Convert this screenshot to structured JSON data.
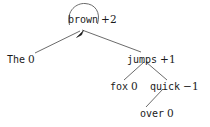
{
  "figure": {
    "type": "dependency-score-tree",
    "background_color": "#ffffff",
    "stroke_color": "#5a5a5a",
    "text_color": "#1a1a1a"
  },
  "nodes": {
    "brown": {
      "word": "brown",
      "score": "+2"
    },
    "the": {
      "word": "The",
      "score": "0"
    },
    "jumps": {
      "word": "jumps",
      "score": "+1"
    },
    "fox": {
      "word": "fox",
      "score": "0"
    },
    "quick": {
      "word": "quick",
      "score": "−1"
    },
    "over": {
      "word": "over",
      "score": "0"
    }
  },
  "icons": {
    "self_loop": "self-loop-arc-icon",
    "arrow_head": "arrowhead-icon"
  },
  "edges": [
    {
      "from": "brown",
      "to": "the"
    },
    {
      "from": "brown",
      "to": "jumps"
    },
    {
      "from": "jumps",
      "to": "fox"
    },
    {
      "from": "jumps",
      "to": "quick"
    },
    {
      "from": "quick",
      "to": "over"
    },
    {
      "from": "brown",
      "to": "brown",
      "kind": "self-loop"
    }
  ]
}
